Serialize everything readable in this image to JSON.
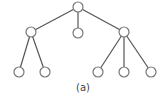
{
  "diagram": {
    "type": "tree",
    "caption": "(a)",
    "colors": {
      "edge": "#555555",
      "node_stroke": "#777777",
      "node_fill": "#ffffff",
      "text": "#444444"
    },
    "node_radius": 5,
    "nodes": [
      {
        "id": "root",
        "x": 78,
        "y": 7
      },
      {
        "id": "l",
        "x": 31,
        "y": 32
      },
      {
        "id": "m",
        "x": 78,
        "y": 33
      },
      {
        "id": "r",
        "x": 124,
        "y": 32
      },
      {
        "id": "ll",
        "x": 19,
        "y": 72
      },
      {
        "id": "lr",
        "x": 45,
        "y": 72
      },
      {
        "id": "rl",
        "x": 98,
        "y": 72
      },
      {
        "id": "rm",
        "x": 124,
        "y": 72
      },
      {
        "id": "rr",
        "x": 151,
        "y": 72
      }
    ],
    "edges": [
      [
        "root",
        "l"
      ],
      [
        "root",
        "m"
      ],
      [
        "root",
        "r"
      ],
      [
        "l",
        "ll"
      ],
      [
        "l",
        "lr"
      ],
      [
        "r",
        "rl"
      ],
      [
        "r",
        "rm"
      ],
      [
        "r",
        "rr"
      ]
    ]
  }
}
